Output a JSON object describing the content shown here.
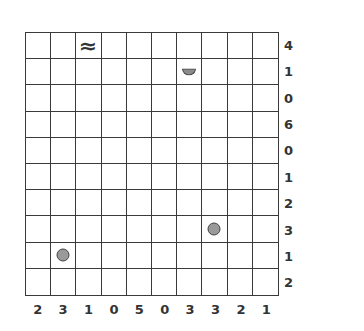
{
  "puzzle": {
    "rows": 10,
    "cols": 10,
    "row_clues": [
      "4",
      "1",
      "0",
      "6",
      "0",
      "1",
      "2",
      "3",
      "1",
      "2"
    ],
    "col_clues": [
      "2",
      "3",
      "1",
      "0",
      "5",
      "0",
      "3",
      "3",
      "2",
      "1"
    ],
    "markers": [
      {
        "row": 0,
        "col": 2,
        "type": "water",
        "icon": "wave-icon",
        "glyph": "≈"
      },
      {
        "row": 1,
        "col": 6,
        "type": "half-circle",
        "icon": "half-circle-icon"
      },
      {
        "row": 7,
        "col": 7,
        "type": "circle",
        "icon": "circle-icon"
      },
      {
        "row": 8,
        "col": 1,
        "type": "circle",
        "icon": "circle-icon"
      }
    ],
    "colors": {
      "grid_line": "#3a3a3a",
      "marker_fill": "#9a9a9a",
      "clue_text": "#333333"
    }
  }
}
